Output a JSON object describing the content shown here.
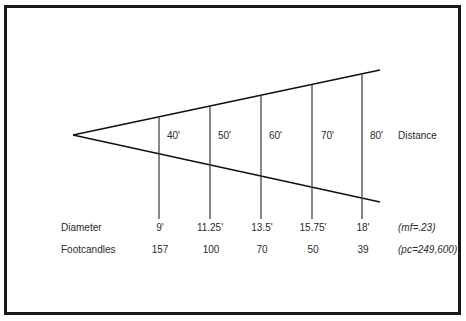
{
  "diagram": {
    "row_labels": {
      "distance": "Distance",
      "diameter": "Diameter",
      "footcandles": "Footcandles"
    },
    "columns": [
      {
        "distance": "40'",
        "diameter": "9'",
        "footcandles": "157"
      },
      {
        "distance": "50'",
        "diameter": "11.25'",
        "footcandles": "100"
      },
      {
        "distance": "60'",
        "diameter": "13.5'",
        "footcandles": "70"
      },
      {
        "distance": "70'",
        "diameter": "15.75'",
        "footcandles": "50"
      },
      {
        "distance": "80'",
        "diameter": "18'",
        "footcandles": "39"
      }
    ],
    "notes": {
      "diameter_note": "(mf=.23)",
      "footcandles_note": "(pc=249,600)"
    }
  }
}
